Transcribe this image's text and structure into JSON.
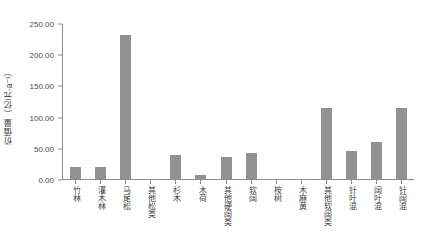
{
  "chart_data": {
    "type": "bar",
    "title": "",
    "xlabel": "",
    "ylabel": "价值量（亿元·a⁻¹）",
    "ylim": [
      0,
      250
    ],
    "yticks": [
      0,
      50,
      100,
      150,
      200,
      250
    ],
    "ytick_labels": [
      "0.00",
      "50.00",
      "100.00",
      "150.00",
      "200.00",
      "250.00"
    ],
    "grid": false,
    "legend": "none",
    "bar_color": "#929292",
    "axis_color": "#8c8c8c",
    "categories": [
      "竹林",
      "灌木林",
      "马尾松",
      "其他松类",
      "杉木",
      "木荷",
      "其他硬阔类",
      "软阔",
      "桉树",
      "木麻黄",
      "其他软阔类",
      "针叶混",
      "阔叶混",
      "针阔混"
    ],
    "values": [
      20.0,
      20.0,
      233.0,
      0.5,
      39.0,
      6.0,
      36.0,
      42.0,
      0.8,
      0.5,
      114.0,
      45.0,
      59.0,
      114.0
    ]
  },
  "caption": {
    "text": ""
  }
}
